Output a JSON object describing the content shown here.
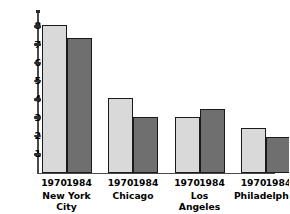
{
  "chart_data": {
    "type": "bar",
    "title": "",
    "xlabel": "",
    "ylabel": "Millions of people",
    "ylim": [
      0,
      8.6
    ],
    "yticks": [
      1,
      2,
      3,
      4,
      5,
      6,
      7,
      8
    ],
    "grid": false,
    "legend": "none",
    "categories": [
      "New York City",
      "Chicago",
      "Los Angeles",
      "Philadelphia"
    ],
    "series": [
      {
        "name": "1970",
        "color": "#d9d9d9",
        "values": [
          8.05,
          4.05,
          3.05,
          2.45
        ]
      },
      {
        "name": "1984",
        "color": "#6f6f6f",
        "values": [
          7.35,
          3.05,
          3.5,
          1.95
        ]
      }
    ],
    "groups": [
      {
        "label_line1": "New York",
        "label_line2": "City",
        "bars": [
          {
            "year": "1970",
            "value": 8.05,
            "style": "light"
          },
          {
            "year": "1984",
            "value": 7.35,
            "style": "dark"
          }
        ]
      },
      {
        "label_line1": "Chicago",
        "label_line2": "",
        "bars": [
          {
            "year": "1970",
            "value": 4.05,
            "style": "light"
          },
          {
            "year": "1984",
            "value": 3.05,
            "style": "dark"
          }
        ]
      },
      {
        "label_line1": "Los",
        "label_line2": "Angeles",
        "bars": [
          {
            "year": "1970",
            "value": 3.05,
            "style": "light"
          },
          {
            "year": "1984",
            "value": 3.5,
            "style": "dark"
          }
        ]
      },
      {
        "label_line1": "Philadelphia",
        "label_line2": "",
        "bars": [
          {
            "year": "1970",
            "value": 2.45,
            "style": "light"
          },
          {
            "year": "1984",
            "value": 1.95,
            "style": "dark"
          }
        ]
      }
    ]
  },
  "axis": {
    "y_label": "Millions of people",
    "tick_labels": [
      "8",
      "7",
      "6",
      "5",
      "4",
      "3",
      "2",
      "1"
    ]
  },
  "colors": {
    "bar_1970": "#d9d9d9",
    "bar_1984": "#6f6f6f",
    "axis": "#4a4a4a",
    "bar_outline": "#1a1a1a",
    "text": "#000000"
  }
}
